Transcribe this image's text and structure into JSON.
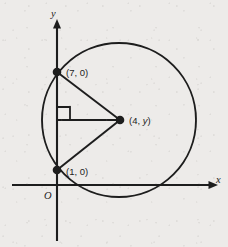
{
  "figure": {
    "background_color": "#edebe9",
    "ink_color": "#1d1d1d",
    "axes": {
      "x_label": "x",
      "y_label": "y",
      "origin_label": "O",
      "x_axis_name": "x-axis",
      "y_axis_name": "y-axis"
    },
    "circle": {
      "center_px": {
        "x": 119,
        "y": 120
      },
      "radius_px": 77,
      "stroke_color": "#1d1d1d"
    },
    "points": [
      {
        "id": "upper-y-intercept",
        "label": "(7, 0)",
        "px": {
          "x": 57,
          "y": 72
        },
        "label_px": {
          "x": 66,
          "y": 76
        }
      },
      {
        "id": "lower-y-intercept",
        "label": "(1, 0)",
        "px": {
          "x": 57,
          "y": 170
        },
        "label_px": {
          "x": 66,
          "y": 175
        }
      },
      {
        "id": "circle-center",
        "label_prefix": "(4, ",
        "label_variable": "y",
        "label_suffix": ")",
        "label_full": "(4, y)",
        "px": {
          "x": 120,
          "y": 120
        },
        "label_px": {
          "x": 129,
          "y": 124
        }
      }
    ],
    "segments": [
      {
        "id": "radius-to-upper-point",
        "from": "circle-center",
        "to": "upper-y-intercept"
      },
      {
        "id": "radius-to-lower-point",
        "from": "circle-center",
        "to": "lower-y-intercept"
      },
      {
        "id": "perpendicular-to-chord",
        "from": "circle-center",
        "to": "y-axis-foot"
      }
    ],
    "right_angle_marker": {
      "id": "right-angle-marker",
      "at_px": {
        "x": 57,
        "y": 120
      },
      "size_px": 13
    }
  }
}
